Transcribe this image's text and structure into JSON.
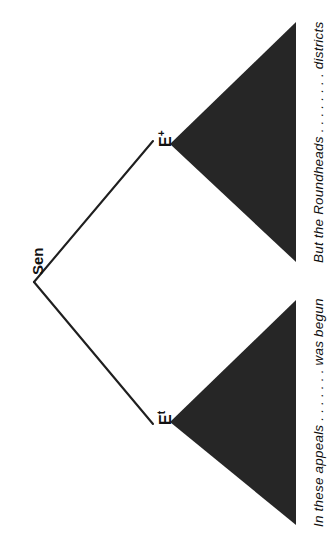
{
  "diagram": {
    "type": "syntax-tree",
    "orientation": "rotated-90-ccw",
    "background_color": "#ffffff",
    "ink_color": "#1a1a1a",
    "triangle_fill": "#262626",
    "root": {
      "label": "Sen"
    },
    "nodes": [
      {
        "id": "node-left",
        "base": "E",
        "superscript": "t",
        "terminal_text": "In these appeals . . . . . . . was begun"
      },
      {
        "id": "node-right",
        "base": "E",
        "superscript": "+",
        "terminal_text": "But the Roundheads . . . . . . . . districts"
      }
    ],
    "terminals": {
      "left": "In these appeals . . . . . . . was begun",
      "right": "But the Roundheads . . . . . . . . districts"
    }
  }
}
